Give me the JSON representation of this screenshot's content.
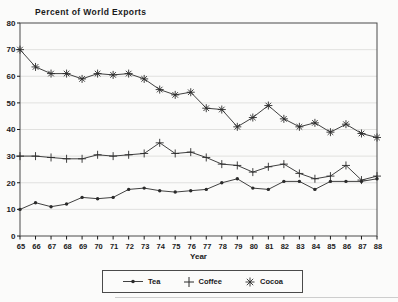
{
  "chart_data": {
    "type": "line",
    "title": "Percent of World Exports",
    "xlabel": "Year",
    "ylabel": "",
    "x": [
      65,
      66,
      67,
      68,
      69,
      70,
      71,
      72,
      73,
      74,
      75,
      76,
      77,
      78,
      79,
      80,
      81,
      82,
      83,
      84,
      85,
      86,
      87,
      88
    ],
    "ylim": [
      0,
      80
    ],
    "yticks": [
      0,
      10,
      20,
      30,
      40,
      50,
      60,
      70,
      80
    ],
    "grid": true,
    "legend_position": "bottom",
    "series": [
      {
        "name": "Tea",
        "marker": "dot",
        "color": "#2b2b2b",
        "values": [
          10,
          12.5,
          11,
          12,
          14.5,
          14,
          14.5,
          17.5,
          18,
          17,
          16.5,
          17,
          17.5,
          20,
          21.5,
          18,
          17.5,
          20.5,
          20.5,
          17.5,
          20.5,
          20.5,
          20.5,
          21.5
        ]
      },
      {
        "name": "Coffee",
        "marker": "plus",
        "color": "#2b2b2b",
        "values": [
          30,
          30,
          29.5,
          29,
          29,
          30.5,
          30,
          30.5,
          31,
          35,
          31,
          31.5,
          29.5,
          27,
          26.5,
          24,
          26,
          27,
          23.5,
          21.5,
          22.5,
          26.5,
          21,
          22.5
        ]
      },
      {
        "name": "Cocoa",
        "marker": "asterisk",
        "color": "#2b2b2b",
        "values": [
          70,
          63.5,
          61,
          61,
          59,
          61,
          60.5,
          61,
          59,
          55,
          53,
          54,
          48,
          47.5,
          41,
          44.5,
          49,
          44,
          41,
          42.5,
          39,
          42,
          38.5,
          37
        ]
      }
    ],
    "colors": {
      "axis": "#4a4a4a",
      "grid": "#dadad8",
      "ink": "#1a1a1a",
      "background": "#fbfbfa"
    }
  }
}
